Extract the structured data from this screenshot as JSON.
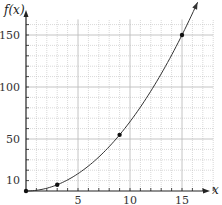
{
  "chart_data": {
    "type": "line",
    "title": "",
    "xlabel": "x",
    "ylabel": "f(x)",
    "function": "f(x) = (2/3)x^2",
    "xlim": [
      0,
      18
    ],
    "ylim": [
      0,
      170
    ],
    "x_ticks": [
      5,
      10,
      15
    ],
    "y_ticks": [
      10,
      50,
      100,
      150
    ],
    "x_minor_step": 1,
    "y_minor_step": 10,
    "grid": true,
    "legend": null,
    "series": [
      {
        "name": "f(x)",
        "x": [
          0,
          3,
          9,
          15
        ],
        "values": [
          0,
          6,
          54,
          150
        ],
        "marked_points": [
          [
            0,
            0
          ],
          [
            3,
            6
          ],
          [
            9,
            54
          ],
          [
            15,
            150
          ]
        ],
        "arrow_end": [
          16.5,
          181.5
        ]
      }
    ]
  },
  "labels": {
    "y_axis": "f(x)",
    "x_axis": "x",
    "x_ticks": [
      "5",
      "10",
      "15"
    ],
    "y_ticks": [
      "10",
      "50",
      "100",
      "150"
    ]
  },
  "colors": {
    "axis": "#222222",
    "grid": "#bdbdbd",
    "curve": "#333333",
    "point": "#111111"
  }
}
